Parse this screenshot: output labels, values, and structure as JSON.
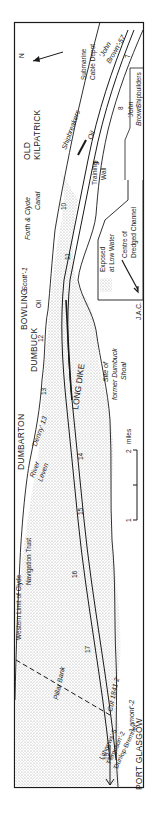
{
  "map": {
    "towns": {
      "old_kilpatrick": [
        "OLD",
        "KILPATRICK"
      ],
      "bowling": "BOWLING",
      "dumbuck": "DUMBUCK",
      "dumbarton": "DUMBARTON",
      "port_glasgow": "PORT GLASGOW"
    },
    "features": {
      "submarine_cable_depot": [
        "Submarine",
        "Cable Depot"
      ],
      "shipbreakers": "Shipbreakers",
      "oil_upper": "Oil",
      "oil_lower": "Oil",
      "training_wall": [
        "Training",
        "Wall"
      ],
      "forth_clyde_canal": [
        "Forth & Clyde",
        "Canal"
      ],
      "long_dike": "LONG DIKE",
      "dumbuck_shoal": [
        "Site of",
        "former Dumbuck",
        "Shoal"
      ],
      "river_leven": [
        "River",
        "Leven"
      ],
      "clyde_trust_limit": [
        "Western Limit of Clyde",
        "Navigation Trust"
      ],
      "pillar_bank": "Pillar Bank",
      "cut": "Cut 1841-2",
      "john_brown_shipbuilders": [
        "'John",
        "Brown'",
        "Shipbuilders"
      ]
    },
    "yards": {
      "john_brown": [
        "'John",
        "Brown'-57"
      ],
      "scott": "'Scott'-1",
      "denny": "'Denny' 13",
      "lamont": "'Lamont'-2",
      "lower_yards": [
        "Lithgows'-5",
        "'Ferguson'-2",
        "'Dunlop-Bremner'"
      ]
    },
    "channel_markers": [
      "7",
      "8",
      "9",
      "10",
      "11",
      "12",
      "13",
      "14",
      "15",
      "16",
      "17",
      "19"
    ],
    "north_arrow": "N",
    "legend": {
      "exposed": [
        "Exposed",
        "at Low Water"
      ],
      "channel": [
        "Centre of",
        "Dredged Channel"
      ]
    },
    "scale": {
      "tick_1": "1",
      "tick_2": "2",
      "unit": "miles"
    },
    "credit": "J.A.C."
  },
  "colors": {
    "ink": "#1a1a1a",
    "stipple": "#bdbdbd",
    "paper": "#ffffff"
  }
}
